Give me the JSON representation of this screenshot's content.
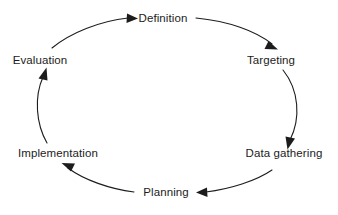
{
  "diagram": {
    "type": "cycle",
    "direction": "clockwise",
    "background_color": "#ffffff",
    "stroke_color": "#1c1c1c",
    "text_color": "#1c1c1c",
    "stage_count": 6,
    "stages": [
      {
        "id": "definition",
        "label": "Definition",
        "position": "top"
      },
      {
        "id": "targeting",
        "label": "Targeting",
        "position": "top-right"
      },
      {
        "id": "data-gathering",
        "label": "Data gathering",
        "position": "bottom-right"
      },
      {
        "id": "planning",
        "label": "Planning",
        "position": "bottom"
      },
      {
        "id": "implementation",
        "label": "Implementation",
        "position": "bottom-left"
      },
      {
        "id": "evaluation",
        "label": "Evaluation",
        "position": "top-left"
      }
    ],
    "arrows": [
      {
        "id": "evaluation-to-definition",
        "from": "Evaluation",
        "to": "Definition",
        "head": "right"
      },
      {
        "id": "definition-to-targeting",
        "from": "Definition",
        "to": "Targeting",
        "head": "down-right"
      },
      {
        "id": "targeting-to-data-gathering",
        "from": "Targeting",
        "to": "Data gathering",
        "head": "down"
      },
      {
        "id": "data-gathering-to-planning",
        "from": "Data gathering",
        "to": "Planning",
        "head": "left"
      },
      {
        "id": "planning-to-implementation",
        "from": "Planning",
        "to": "Implementation",
        "head": "up-left"
      },
      {
        "id": "implementation-to-evaluation",
        "from": "Implementation",
        "to": "Evaluation",
        "head": "up-right"
      }
    ]
  }
}
